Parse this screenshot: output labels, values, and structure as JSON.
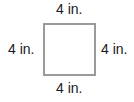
{
  "figure": {
    "shape": "square",
    "labels": {
      "top": "4 in.",
      "bottom": "4 in.",
      "left": "4 in.",
      "right": "4 in."
    },
    "border_color": "#9a9a9a"
  }
}
